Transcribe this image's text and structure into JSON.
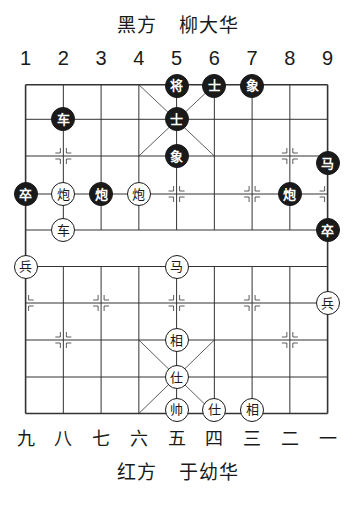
{
  "header": {
    "side": "黑方",
    "player": "柳大华"
  },
  "footer": {
    "side": "红方",
    "player": "于幼华"
  },
  "file_numbers_top": [
    "1",
    "2",
    "3",
    "4",
    "5",
    "6",
    "7",
    "8",
    "9"
  ],
  "file_numbers_bottom": [
    "九",
    "八",
    "七",
    "六",
    "五",
    "四",
    "三",
    "二",
    "一"
  ],
  "colors": {
    "line": "#333333",
    "black_piece": "#1a1a1a",
    "red_piece_fill": "#ffffff"
  },
  "board": {
    "files": 9,
    "ranks": 10,
    "pieces": [
      {
        "side": "black",
        "char": "将",
        "file": 5,
        "rank": 0
      },
      {
        "side": "black",
        "char": "士",
        "file": 6,
        "rank": 0
      },
      {
        "side": "black",
        "char": "象",
        "file": 7,
        "rank": 0
      },
      {
        "side": "black",
        "char": "车",
        "file": 2,
        "rank": 1
      },
      {
        "side": "black",
        "char": "士",
        "file": 5,
        "rank": 1
      },
      {
        "side": "black",
        "char": "象",
        "file": 5,
        "rank": 2
      },
      {
        "side": "black",
        "char": "马",
        "file": 9,
        "rank": 2
      },
      {
        "side": "black",
        "char": "卒",
        "file": 1,
        "rank": 3
      },
      {
        "side": "red",
        "char": "炮",
        "file": 2,
        "rank": 3
      },
      {
        "side": "black",
        "char": "炮",
        "file": 3,
        "rank": 3
      },
      {
        "side": "red",
        "char": "炮",
        "file": 4,
        "rank": 3
      },
      {
        "side": "black",
        "char": "炮",
        "file": 8,
        "rank": 3
      },
      {
        "side": "red",
        "char": "车",
        "file": 2,
        "rank": 4
      },
      {
        "side": "black",
        "char": "卒",
        "file": 9,
        "rank": 4
      },
      {
        "side": "red",
        "char": "兵",
        "file": 1,
        "rank": 5
      },
      {
        "side": "red",
        "char": "马",
        "file": 5,
        "rank": 5
      },
      {
        "side": "red",
        "char": "兵",
        "file": 9,
        "rank": 6
      },
      {
        "side": "red",
        "char": "相",
        "file": 5,
        "rank": 7
      },
      {
        "side": "red",
        "char": "仕",
        "file": 5,
        "rank": 8
      },
      {
        "side": "red",
        "char": "帅",
        "file": 5,
        "rank": 9
      },
      {
        "side": "red",
        "char": "仕",
        "file": 6,
        "rank": 9
      },
      {
        "side": "red",
        "char": "相",
        "file": 7,
        "rank": 9
      }
    ]
  }
}
